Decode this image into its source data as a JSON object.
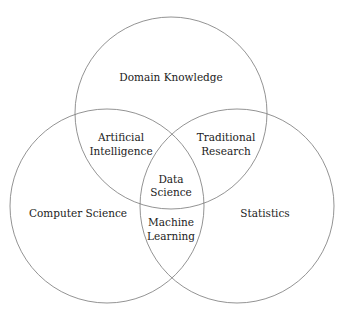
{
  "diagram": {
    "type": "venn",
    "circles": [
      {
        "id": "domain",
        "label": "Domain Knowledge",
        "cx": 171,
        "cy": 113,
        "r": 96
      },
      {
        "id": "cs",
        "label": "Computer Science",
        "cx": 107,
        "cy": 206,
        "r": 97
      },
      {
        "id": "stats",
        "label": "Statistics",
        "cx": 237,
        "cy": 206,
        "r": 97
      }
    ],
    "intersections": {
      "domain_cs": {
        "line1": "Artificial",
        "line2": "Intelligence"
      },
      "domain_stats": {
        "line1": "Traditional",
        "line2": "Research"
      },
      "all": {
        "line1": "Data",
        "line2": "Science"
      },
      "cs_stats": {
        "line1": "Machine",
        "line2": "Learning"
      }
    },
    "stroke_color": "#777777"
  }
}
